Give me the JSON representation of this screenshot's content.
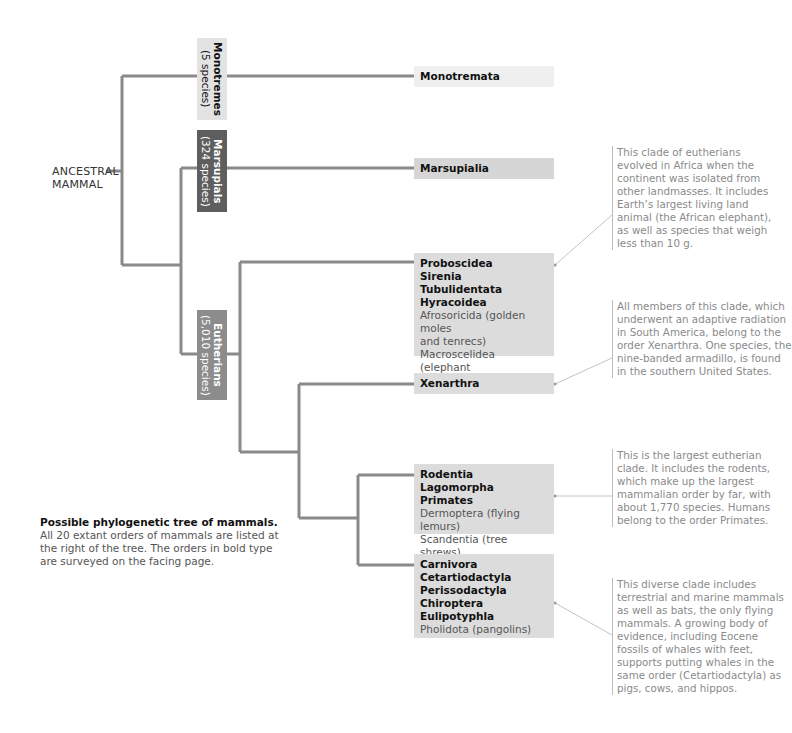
{
  "root": {
    "label_line1": "ANCESTRAL",
    "label_line2": "MAMMAL"
  },
  "groups": {
    "monotremes": {
      "name": "Monotremes",
      "count": "(5 species)",
      "color": "#e3e3e3",
      "text_color": "#111111"
    },
    "marsupials": {
      "name": "Marsupials",
      "count": "(324 species)",
      "color": "#5e5e5e",
      "text_color": "#ffffff"
    },
    "eutherians": {
      "name": "Eutherians",
      "count": "(5,010 species)",
      "color": "#8c8c8c",
      "text_color": "#ffffff"
    }
  },
  "orders": {
    "monotremata": {
      "bold": [
        "Monotremata"
      ],
      "regular": [],
      "color": "#efefef"
    },
    "marsupialia": {
      "bold": [
        "Marsupialia"
      ],
      "regular": [],
      "color": "#d6d6d6"
    },
    "afrotheria": {
      "bold": [
        "Proboscidea",
        "Sirenia",
        "Tubulidentata",
        "Hyracoidea"
      ],
      "regular": [
        "Afrosoricida (golden moles",
        "and tenrecs)",
        "Macroscelidea (elephant",
        "shrews)"
      ],
      "color": "#dcdcdc"
    },
    "xenarthra": {
      "bold": [
        "Xenarthra"
      ],
      "regular": [],
      "color": "#dcdcdc"
    },
    "euarchontoglires": {
      "bold": [
        "Rodentia",
        "Lagomorpha",
        "Primates"
      ],
      "regular": [
        "Dermoptera (flying lemurs)",
        "Scandentia (tree shrews)"
      ],
      "color": "#dcdcdc"
    },
    "laurasiatheria": {
      "bold": [
        "Carnivora",
        "Cetartiodactyla",
        "Perissodactyla",
        "Chiroptera",
        "Eulipotyphla"
      ],
      "regular": [
        "Pholidota (pangolins)"
      ],
      "color": "#dcdcdc"
    }
  },
  "notes": {
    "afrotheria": "This clade of eutherians evolved in Africa when the continent was isolated from other landmasses. It includes Earth’s largest living land animal (the African elephant), as well as species that weigh less than 10 g.",
    "xenarthra": "All members of this clade, which underwent an adaptive radiation in South America, belong to the order Xenarthra. One species, the nine-banded armadillo, is found in the southern United States.",
    "euarchontoglires": "This is the largest eutherian clade. It includes the rodents, which make up the largest mammalian order by far, with about 1,770 species. Humans belong to the order Primates.",
    "laurasiatheria": "This diverse clade includes terrestrial and marine mammals as well as bats, the only flying mammals. A growing body of evidence, including Eocene fossils of whales with feet, supports putting whales in the same order (Cetartiodactyla) as pigs, cows, and hippos."
  },
  "caption": {
    "title": "Possible phylogenetic tree of mammals.",
    "body": "All 20 extant orders of mammals are listed at the right of the tree. The orders in bold type are surveyed on the facing page."
  },
  "colors": {
    "branch": "#8a8a8a",
    "leader": "#c4c4c4"
  }
}
